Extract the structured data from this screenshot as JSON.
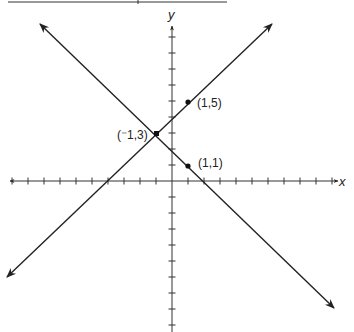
{
  "diagram": {
    "type": "coordinate-plane",
    "axes": {
      "x_label": "x",
      "y_label": "y",
      "x_ticks_range": [
        -10,
        10
      ],
      "y_ticks_range": [
        -9,
        9
      ]
    },
    "lines": [
      {
        "name": "line-through-neg1-3-and-1-5",
        "equation": "y = x + 4",
        "through": [
          "(-1,3)",
          "(1,5)"
        ]
      },
      {
        "name": "line-through-neg1-3-and-1-1",
        "equation": "y = -x + 2",
        "through": [
          "(-1,3)",
          "(1,1)"
        ]
      }
    ],
    "points": [
      {
        "label": "(⁻1,3)",
        "x": -1,
        "y": 3
      },
      {
        "label": "(1,5)",
        "x": 1,
        "y": 5
      },
      {
        "label": "(1,1)",
        "x": 1,
        "y": 1
      }
    ],
    "colors": {
      "ink": "#222222",
      "background": "#ffffff"
    }
  }
}
